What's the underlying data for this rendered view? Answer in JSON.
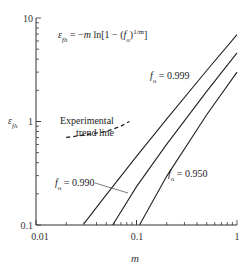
{
  "chart_data": {
    "type": "line",
    "title": "",
    "equation": "ε_fh = −m ln[1 − (f_o)^(1/m)]",
    "xlabel": "m",
    "ylabel": "ε_fh",
    "xscale": "log",
    "yscale": "log",
    "xlim": [
      0.01,
      1
    ],
    "ylim": [
      0.1,
      10
    ],
    "x_tick_labels": [
      "0.01",
      "0.1",
      "1"
    ],
    "y_tick_labels": [
      "0.1",
      "1",
      "10"
    ],
    "grid": false,
    "legend": null,
    "series": [
      {
        "name": "f_o = 0.999",
        "label": "0.999",
        "style": "solid",
        "x": [
          0.03,
          0.05,
          0.1,
          0.2,
          0.5,
          1.0
        ],
        "y": [
          0.103,
          0.196,
          0.461,
          1.06,
          3.11,
          6.91
        ]
      },
      {
        "name": "f_o = 0.990",
        "label": "0.990",
        "style": "solid",
        "x": [
          0.058,
          0.1,
          0.2,
          0.5,
          1.0
        ],
        "y": [
          0.1,
          0.235,
          0.603,
          1.96,
          4.61
        ]
      },
      {
        "name": "f_o = 0.950",
        "label": "0.950",
        "style": "solid",
        "x": [
          0.107,
          0.2,
          0.5,
          1.0
        ],
        "y": [
          0.1,
          0.297,
          1.16,
          3.0
        ]
      },
      {
        "name": "Experimental trend line",
        "style": "dashed",
        "x": [
          0.02,
          0.03,
          0.05,
          0.07,
          0.085
        ],
        "y": [
          0.7,
          0.74,
          0.8,
          0.9,
          1.0
        ]
      }
    ],
    "annotations": [
      {
        "text": "Experimental",
        "text2": "trend line"
      },
      {
        "prefix": "f",
        "sub": "o",
        "text": " = 0.999"
      },
      {
        "prefix": "f",
        "sub": "o",
        "text": " = 0.990"
      },
      {
        "prefix": "f",
        "sub": "o",
        "text": " = 0.950"
      }
    ]
  }
}
